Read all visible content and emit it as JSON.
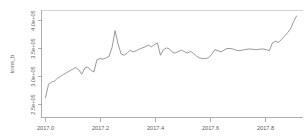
{
  "chart_data": {
    "type": "line",
    "title": "",
    "subtitle": "",
    "xlabel": "",
    "ylabel": "tcms_b",
    "xlim": [
      2016.985,
      2017.93
    ],
    "ylim": [
      235000,
      425000
    ],
    "grid": false,
    "legend": null,
    "xticks": [
      "2017.0",
      "2017.2",
      "2017.4",
      "2017.6",
      "2017.8"
    ],
    "xtick_values": [
      2017.0,
      2017.2,
      2017.4,
      2017.6,
      2017.8
    ],
    "yticks": [
      "2.5e+05",
      "3.0e+05",
      "3.5e+05",
      "4.0e+05"
    ],
    "ytick_values": [
      250000,
      300000,
      350000,
      400000
    ],
    "line_color": "#8d8d8d",
    "series": [
      {
        "name": "tcms_b",
        "x": [
          2017.0,
          2017.011,
          2017.022,
          2017.033,
          2017.044,
          2017.055,
          2017.066,
          2017.077,
          2017.088,
          2017.099,
          2017.11,
          2017.121,
          2017.132,
          2017.143,
          2017.154,
          2017.165,
          2017.176,
          2017.187,
          2017.198,
          2017.209,
          2017.22,
          2017.231,
          2017.242,
          2017.253,
          2017.264,
          2017.275,
          2017.286,
          2017.297,
          2017.308,
          2017.319,
          2017.33,
          2017.341,
          2017.352,
          2017.363,
          2017.374,
          2017.385,
          2017.396,
          2017.407,
          2017.418,
          2017.429,
          2017.44,
          2017.451,
          2017.462,
          2017.473,
          2017.484,
          2017.495,
          2017.506,
          2017.517,
          2017.528,
          2017.539,
          2017.55,
          2017.561,
          2017.572,
          2017.583,
          2017.594,
          2017.605,
          2017.616,
          2017.627,
          2017.638,
          2017.649,
          2017.66,
          2017.671,
          2017.682,
          2017.693,
          2017.704,
          2017.715,
          2017.726,
          2017.737,
          2017.748,
          2017.759,
          2017.77,
          2017.781,
          2017.792,
          2017.803,
          2017.814,
          2017.825,
          2017.836,
          2017.847,
          2017.858,
          2017.869,
          2017.88,
          2017.891,
          2017.902,
          2017.913
        ],
        "values": [
          262000,
          286000,
          290000,
          292000,
          297000,
          300000,
          304000,
          307000,
          310000,
          313000,
          316000,
          312000,
          304000,
          315000,
          317000,
          311000,
          308000,
          330000,
          332000,
          331000,
          333000,
          336000,
          352000,
          382000,
          358000,
          340000,
          338000,
          342000,
          347000,
          344000,
          346000,
          349000,
          351000,
          353000,
          356000,
          353000,
          357000,
          360000,
          338000,
          348000,
          351000,
          349000,
          343000,
          342000,
          345000,
          347000,
          344000,
          342000,
          345000,
          341000,
          336000,
          333000,
          332000,
          332000,
          334000,
          340000,
          348000,
          346000,
          344000,
          347000,
          350000,
          350000,
          349000,
          347000,
          346000,
          347000,
          348000,
          349000,
          349000,
          348000,
          348000,
          349000,
          349000,
          348000,
          346000,
          360000,
          363000,
          361000,
          366000,
          372000,
          378000,
          385000,
          398000,
          408000
        ]
      }
    ]
  }
}
